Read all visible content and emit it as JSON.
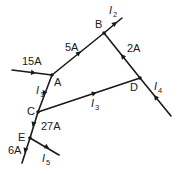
{
  "diagram": {
    "type": "circuit-current-network",
    "nodes": [
      {
        "id": "A",
        "label": "A"
      },
      {
        "id": "B",
        "label": "B"
      },
      {
        "id": "C",
        "label": "C"
      },
      {
        "id": "D",
        "label": "D"
      },
      {
        "id": "E",
        "label": "E"
      }
    ],
    "currents": {
      "in_A": "15A",
      "A_to_B": "5A",
      "D_to_B": "2A",
      "C_to_E": "27A",
      "E_out": "6A",
      "I1": {
        "symbol": "I",
        "sub": "1"
      },
      "I2": {
        "symbol": "I",
        "sub": "2"
      },
      "I3": {
        "symbol": "I",
        "sub": "3"
      },
      "I4": {
        "symbol": "I",
        "sub": "4"
      },
      "I5": {
        "symbol": "I",
        "sub": "5"
      }
    },
    "colors": {
      "line": "#1a1a1a",
      "background": "#ffffff"
    }
  }
}
